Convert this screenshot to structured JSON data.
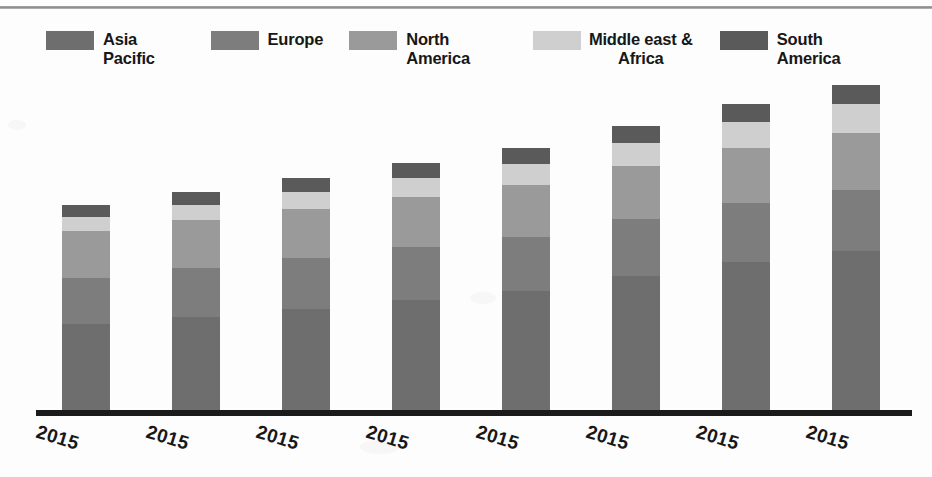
{
  "chart_data": {
    "type": "bar",
    "stacked": true,
    "title": "",
    "xlabel": "",
    "ylabel": "",
    "grid": false,
    "legend_position": "top",
    "categories": [
      "2015",
      "2015",
      "2015",
      "2015",
      "2015",
      "2015",
      "2015",
      "2015"
    ],
    "series": [
      {
        "name": "Asia Pacific",
        "color": "#6e6e6e",
        "values": [
          94,
          102,
          110,
          120,
          129,
          145,
          160,
          172
        ]
      },
      {
        "name": "Europe",
        "color": "#7d7d7d",
        "values": [
          49,
          52,
          54,
          56,
          58,
          61,
          63,
          65
        ]
      },
      {
        "name": "North America",
        "color": "#9a9a9a",
        "values": [
          50,
          51,
          52,
          53,
          55,
          56,
          58,
          60
        ]
      },
      {
        "name": "Middle east & Africa",
        "color": "#cfcfcf",
        "values": [
          15,
          16,
          18,
          20,
          22,
          25,
          28,
          31
        ]
      },
      {
        "name": "South America",
        "color": "#5a5a5a",
        "values": [
          13,
          14,
          15,
          16,
          17,
          18,
          19,
          20
        ]
      }
    ],
    "ylim": [
      0,
      360
    ],
    "totals": [
      221,
      235,
      249,
      265,
      281,
      305,
      328,
      348
    ]
  },
  "legend": {
    "items": [
      {
        "label": "Asia Pacific",
        "color": "#6e6e6e",
        "wrap": false
      },
      {
        "label": "Europe",
        "color": "#7d7d7d",
        "wrap": false
      },
      {
        "label": "North America",
        "color": "#9a9a9a",
        "wrap": false
      },
      {
        "label": "Middle east &\nAfrica",
        "color": "#cfcfcf",
        "wrap": true
      },
      {
        "label": "South America",
        "color": "#5a5a5a",
        "wrap": false
      }
    ]
  },
  "axis": {
    "tick_labels": [
      "2015",
      "2015",
      "2015",
      "2015",
      "2015",
      "2015",
      "2015",
      "2015"
    ]
  }
}
